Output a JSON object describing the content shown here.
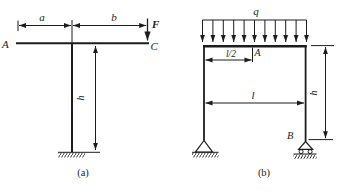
{
  "colors": {
    "background": "#ffffff",
    "ink": "#1c1c1c"
  },
  "figure_a": {
    "caption": "(a)",
    "point_label_left": "A",
    "point_label_right": "C",
    "force_label": "F",
    "dim_a_label": "a",
    "dim_b_label": "b",
    "dim_h_label": "h"
  },
  "figure_b": {
    "caption": "(b)",
    "load_label": "q",
    "dim_half_span_label": "l/2",
    "point_label_mid": "A",
    "dim_span_label": "l",
    "dim_h_label": "h",
    "support_label": "B"
  }
}
